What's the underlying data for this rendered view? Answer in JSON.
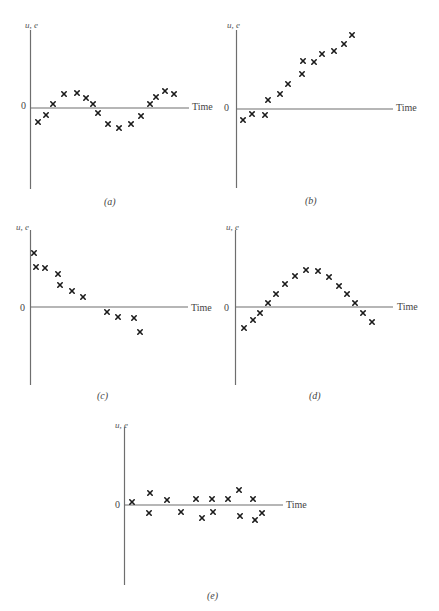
{
  "chart_data": [
    {
      "id": "a",
      "type": "scatter",
      "caption": "(a)",
      "ylabel": "u, e",
      "xlabel": "Time",
      "zero_label": "0",
      "pattern": "cyclical",
      "x": [
        1,
        2,
        3,
        4,
        5,
        6,
        7,
        8,
        9,
        10,
        11,
        12,
        13,
        14,
        15,
        16,
        17
      ],
      "values": [
        -1.3,
        -0.7,
        0.4,
        1.4,
        1.5,
        1.0,
        0.4,
        -0.5,
        -1.5,
        -1.9,
        -1.6,
        -0.8,
        0.4,
        1.1,
        1.6,
        1.5,
        1.3
      ],
      "points": [
        [
          38,
          122
        ],
        [
          46,
          115
        ],
        [
          53,
          104
        ],
        [
          64,
          94
        ],
        [
          77,
          93
        ],
        [
          86,
          98
        ],
        [
          93,
          104
        ],
        [
          98,
          113
        ],
        [
          108,
          124
        ],
        [
          119,
          128
        ],
        [
          131,
          124
        ],
        [
          141,
          116
        ],
        [
          150,
          104
        ],
        [
          156,
          97
        ],
        [
          165,
          91
        ],
        [
          174,
          94
        ]
      ]
    },
    {
      "id": "b",
      "type": "scatter",
      "caption": "(b)",
      "ylabel": "u, e",
      "xlabel": "Time",
      "zero_label": "0",
      "pattern": "linear-trend",
      "points": [
        [
          243,
          120
        ],
        [
          252,
          114
        ],
        [
          265,
          115
        ],
        [
          268,
          100
        ],
        [
          280,
          94
        ],
        [
          288,
          84
        ],
        [
          302,
          74
        ],
        [
          303,
          61
        ],
        [
          314,
          62
        ],
        [
          322,
          54
        ],
        [
          334,
          51
        ],
        [
          344,
          44
        ],
        [
          352,
          35
        ]
      ]
    },
    {
      "id": "c",
      "type": "scatter",
      "caption": "(c)",
      "ylabel": "u, e",
      "xlabel": "Time",
      "zero_label": "0",
      "pattern": "decreasing-trend",
      "points": [
        [
          34,
          253
        ],
        [
          36,
          267
        ],
        [
          45,
          268
        ],
        [
          58,
          274
        ],
        [
          60,
          285
        ],
        [
          72,
          291
        ],
        [
          83,
          297
        ],
        [
          107,
          312
        ],
        [
          118,
          317
        ],
        [
          134,
          318
        ],
        [
          140,
          332
        ]
      ]
    },
    {
      "id": "d",
      "type": "scatter",
      "caption": "(d)",
      "ylabel": "u, e",
      "xlabel": "Time",
      "zero_label": "0",
      "pattern": "quadratic",
      "points": [
        [
          244,
          328
        ],
        [
          253,
          320
        ],
        [
          260,
          313
        ],
        [
          268,
          303
        ],
        [
          276,
          294
        ],
        [
          285,
          284
        ],
        [
          295,
          276
        ],
        [
          306,
          270
        ],
        [
          318,
          271
        ],
        [
          329,
          277
        ],
        [
          339,
          286
        ],
        [
          347,
          294
        ],
        [
          355,
          303
        ],
        [
          363,
          313
        ],
        [
          372,
          322
        ]
      ]
    },
    {
      "id": "e",
      "type": "scatter",
      "caption": "(e)",
      "ylabel": "u, e",
      "xlabel": "Time",
      "zero_label": "0",
      "pattern": "random-around-zero",
      "points": [
        [
          132,
          502
        ],
        [
          150,
          493
        ],
        [
          149,
          513
        ],
        [
          167,
          500
        ],
        [
          181,
          512
        ],
        [
          196,
          499
        ],
        [
          202,
          518
        ],
        [
          213,
          512
        ],
        [
          212,
          499
        ],
        [
          228,
          499
        ],
        [
          239,
          490
        ],
        [
          240,
          516
        ],
        [
          253,
          499
        ],
        [
          255,
          520
        ],
        [
          262,
          513
        ]
      ]
    }
  ]
}
